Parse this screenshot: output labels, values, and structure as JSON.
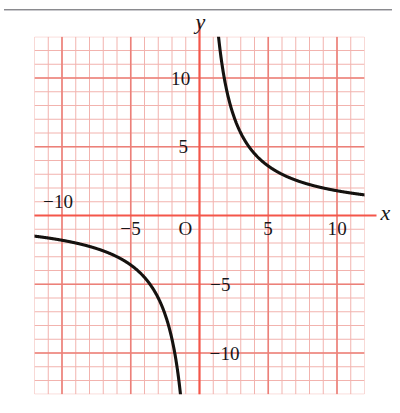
{
  "figure": {
    "name": "coordinate-plane-hyperbola",
    "background_color": "#ffffff",
    "top_rule_color": "#8a8a8e",
    "grid": {
      "minor_color": "#f2b3ae",
      "major_color": "#ec8079",
      "axis_color": "#f4564a",
      "curve_color": "#15120f",
      "minor_step_units": 1,
      "major_step_units": 5,
      "x_min": -12,
      "x_max": 12,
      "y_min": -13,
      "y_max": 13
    },
    "axis_labels": {
      "x": "x",
      "y": "y",
      "origin": "O"
    },
    "x_ticks": [
      {
        "value": -10,
        "label": "−10"
      },
      {
        "value": -5,
        "label": "−5"
      },
      {
        "value": 5,
        "label": "5"
      },
      {
        "value": 10,
        "label": "10"
      }
    ],
    "y_ticks": [
      {
        "value": 10,
        "label": "10"
      },
      {
        "value": 5,
        "label": "5"
      },
      {
        "value": -5,
        "label": "−5"
      },
      {
        "value": -10,
        "label": "−10"
      }
    ]
  },
  "chart_data": {
    "type": "line",
    "title": "",
    "xlabel": "x",
    "ylabel": "y",
    "xlim": [
      -12,
      12
    ],
    "ylim": [
      -13,
      13
    ],
    "grid": true,
    "legend": null,
    "function": "y = 18 / x",
    "series": [
      {
        "name": "y = 18/x (right branch)",
        "x": [
          1.45,
          1.6,
          1.8,
          2.0,
          2.25,
          2.5,
          2.75,
          3.0,
          3.5,
          4.0,
          4.5,
          5.0,
          5.5,
          6.0,
          7.0,
          8.0,
          9.0,
          10.0,
          11.0,
          11.8
        ],
        "y": [
          12.41,
          11.25,
          10.0,
          9.0,
          8.0,
          7.2,
          6.55,
          6.0,
          5.14,
          4.5,
          4.0,
          3.6,
          3.27,
          3.0,
          2.57,
          2.25,
          2.0,
          1.8,
          1.64,
          1.53
        ]
      },
      {
        "name": "y = 18/x (left branch)",
        "x": [
          -11.8,
          -11.0,
          -10.0,
          -9.0,
          -8.0,
          -7.0,
          -6.0,
          -5.5,
          -5.0,
          -4.5,
          -4.0,
          -3.5,
          -3.0,
          -2.75,
          -2.5,
          -2.25,
          -2.0,
          -1.8,
          -1.6,
          -1.45
        ],
        "y": [
          1.53,
          1.64,
          1.8,
          2.0,
          2.25,
          2.57,
          3.0,
          3.27,
          3.6,
          4.0,
          4.5,
          5.14,
          6.0,
          6.55,
          7.2,
          8.0,
          9.0,
          10.0,
          11.25,
          12.41
        ]
      }
    ],
    "xticks": [
      -10,
      -5,
      5,
      10
    ],
    "yticks": [
      -10,
      -5,
      5,
      10
    ],
    "xticklabels": [
      "−10",
      "−5",
      "5",
      "10"
    ],
    "yticklabels": [
      "−10",
      "−5",
      "5",
      "10"
    ]
  }
}
